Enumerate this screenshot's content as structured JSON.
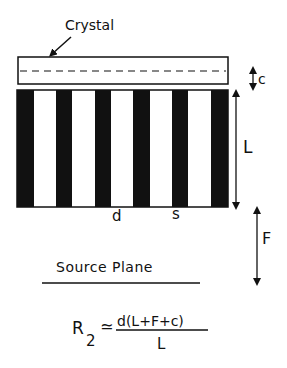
{
  "diagram": {
    "crystal_label": "Crystal",
    "c_label": "c",
    "l_label": "L",
    "f_label": "F",
    "d_label": "d",
    "s_label": "s",
    "source_plane_label": "Source Plane",
    "formula": {
      "lhs": "R",
      "subscript": "2",
      "approx": "≃",
      "numerator": "d(L+F+c)",
      "denominator": "L"
    },
    "colors": {
      "ink": "#111111",
      "background": "#ffffff"
    },
    "grating": {
      "bar_count": 6,
      "bar_x": [
        17,
        56,
        95,
        133,
        172,
        211
      ]
    }
  }
}
